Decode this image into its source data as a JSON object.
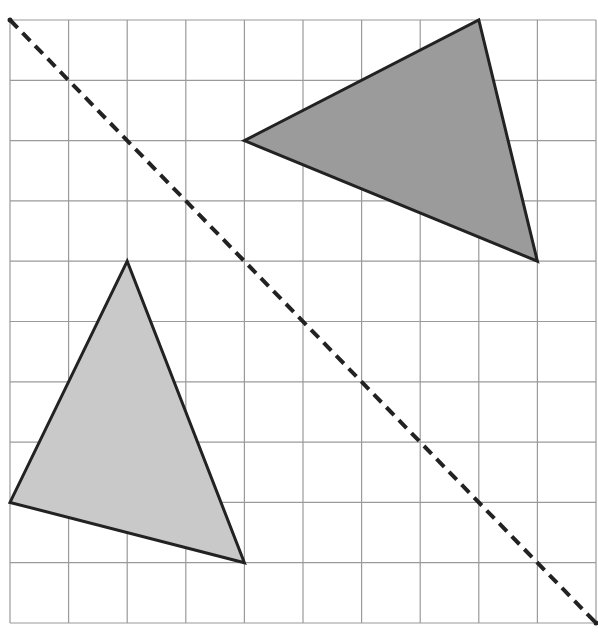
{
  "diagram": {
    "type": "reflection-on-grid",
    "grid": {
      "columns": 10,
      "rows": 10,
      "origin_px": [
        10,
        20
      ],
      "cell_w_px": 58.6,
      "cell_h_px": 60.3,
      "line_color": "#9a9a9a"
    },
    "mirror_line": {
      "from": [
        0,
        0
      ],
      "to": [
        10,
        10
      ],
      "style": "dashed",
      "color": "#222222"
    },
    "shapes": [
      {
        "name": "dark-triangle",
        "vertices": [
          [
            4,
            2
          ],
          [
            8,
            0
          ],
          [
            9,
            4
          ]
        ],
        "fill": "#9b9b9b",
        "stroke": "#222222"
      },
      {
        "name": "light-triangle",
        "vertices": [
          [
            2,
            4
          ],
          [
            0,
            8
          ],
          [
            4,
            9
          ]
        ],
        "fill": "#c9c9c9",
        "stroke": "#222222"
      }
    ]
  }
}
